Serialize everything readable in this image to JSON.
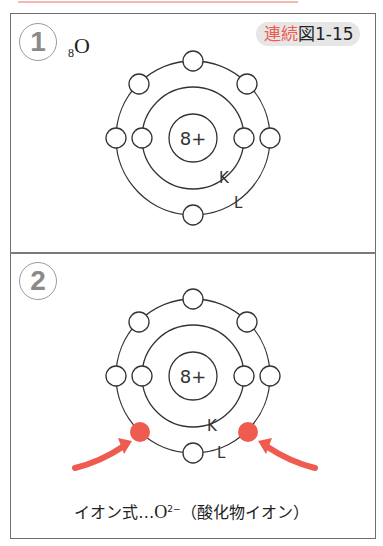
{
  "figure_label": {
    "prefix": "連続",
    "box_char": "図",
    "number": "1-15"
  },
  "panels": [
    {
      "index": "1",
      "element": {
        "atomic_number": "8",
        "symbol": "O"
      },
      "nucleus": "8+",
      "shells": [
        {
          "name": "K",
          "electrons": 2
        },
        {
          "name": "L",
          "electrons": 6
        }
      ],
      "added_electrons": 0
    },
    {
      "index": "2",
      "nucleus": "8+",
      "shells": [
        {
          "name": "K",
          "electrons": 2
        },
        {
          "name": "L",
          "electrons": 8
        }
      ],
      "added_electrons": 2,
      "ion_formula": {
        "label": "イオン式…",
        "symbol": "O",
        "charge": "2−",
        "name": "（酸化物イオン）"
      }
    }
  ],
  "colors": {
    "accent": "#ee5b4f",
    "line": "#333333",
    "badge_bg": "#e6e6e6"
  }
}
